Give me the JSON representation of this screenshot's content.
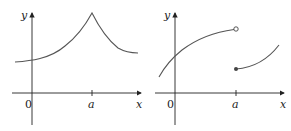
{
  "figures": [
    {
      "id": "left",
      "description": "Continuous function with a sharp corner (cusp) at x = a",
      "labels": {
        "y_axis": "y",
        "x_axis": "x",
        "origin": "0",
        "tick": "a"
      }
    },
    {
      "id": "right",
      "description": "Function with a jump discontinuity at x = a (open circle above, filled dot below)",
      "labels": {
        "y_axis": "y",
        "x_axis": "x",
        "origin": "0",
        "tick": "a"
      }
    }
  ],
  "colors": {
    "axis": "#222222",
    "curve": "#555555",
    "text": "#222222"
  }
}
